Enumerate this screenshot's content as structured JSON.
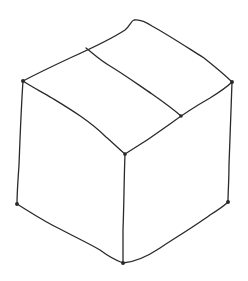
{
  "image": {
    "subject": "Hand-drawn sketch of a closed cardboard box (cube) in isometric view",
    "stroke_color": "#2a2a2a",
    "background_color": "#ffffff",
    "stroke_width": 1.3
  },
  "box": {
    "vertices": {
      "top_apex": [
        133,
        20
      ],
      "top_left": [
        23,
        81
      ],
      "top_right": [
        232,
        82
      ],
      "front_top": [
        125,
        154
      ],
      "bottom_left": [
        17,
        204
      ],
      "bottom_right": [
        228,
        202
      ],
      "bottom_front": [
        123,
        263
      ]
    },
    "flap_seam": {
      "start": [
        86,
        48
      ],
      "end": [
        181,
        116
      ]
    },
    "faces": [
      "top",
      "left",
      "right"
    ]
  }
}
